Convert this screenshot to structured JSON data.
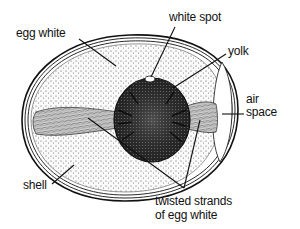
{
  "diagram": {
    "labels": {
      "egg_white": "egg white",
      "white_spot": "white spot",
      "yolk": "yolk",
      "air_space_line1": "air",
      "air_space_line2": "space",
      "shell": "shell",
      "twisted_strands_line1": "twisted strands",
      "twisted_strands_line2": "of egg white"
    },
    "colors": {
      "ink": "#111111",
      "background": "#ffffff",
      "yolk_fill": "#3a3a3a",
      "albumen_fill": "#f2f2f2"
    }
  }
}
